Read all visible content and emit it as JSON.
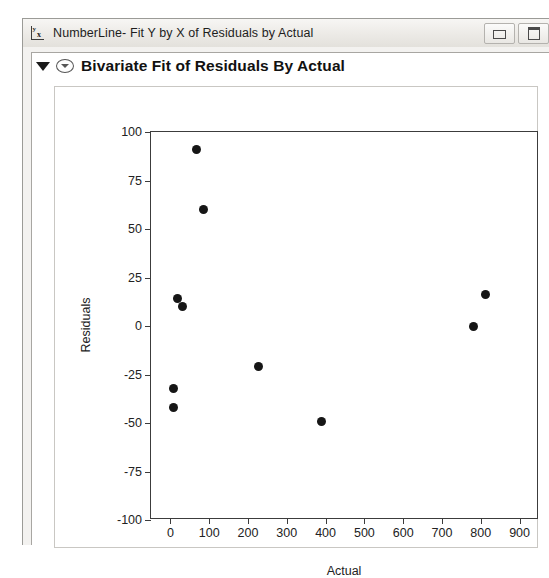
{
  "window": {
    "title": "NumberLine- Fit Y by X of Residuals by Actual",
    "app_icon": "numberline-icon",
    "icon_glyph_y": "y",
    "icon_glyph_x": "x",
    "controls": [
      {
        "name": "minimize-button",
        "glyph": "minimize-icon"
      },
      {
        "name": "maximize-button",
        "glyph": "maximize-icon"
      }
    ]
  },
  "report": {
    "section_title": "Bivariate Fit of Residuals By Actual",
    "outline_triangle": "triangle-down-icon",
    "disclosure": "disclosure-oval-icon"
  },
  "chart_data": {
    "type": "scatter",
    "title": "Bivariate Fit of Residuals By Actual",
    "xlabel": "Actual",
    "ylabel": "Residuals",
    "xlim": [
      -50,
      950
    ],
    "ylim": [
      -100,
      100
    ],
    "xticks": [
      0,
      100,
      200,
      300,
      400,
      500,
      600,
      700,
      800,
      900
    ],
    "yticks": [
      100,
      75,
      50,
      25,
      0,
      -25,
      -50,
      -75,
      -100
    ],
    "grid": false,
    "legend": "none",
    "marker": {
      "shape": "circle",
      "color": "#161616",
      "size": 9
    },
    "points": [
      {
        "x": 8,
        "y": -42
      },
      {
        "x": 8,
        "y": -32
      },
      {
        "x": 18,
        "y": 14
      },
      {
        "x": 32,
        "y": 10
      },
      {
        "x": 68,
        "y": 91
      },
      {
        "x": 85,
        "y": 60
      },
      {
        "x": 228,
        "y": -21
      },
      {
        "x": 390,
        "y": -49
      },
      {
        "x": 782,
        "y": 0
      },
      {
        "x": 812,
        "y": 16
      }
    ]
  }
}
